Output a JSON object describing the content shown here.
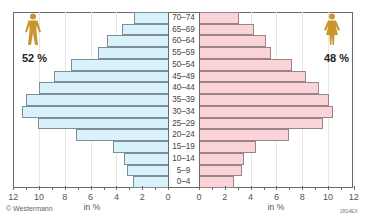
{
  "chart_data": {
    "type": "bar",
    "subtype": "population-pyramid",
    "orientation": "horizontal",
    "categories": [
      "70–74",
      "65–69",
      "60–64",
      "55–59",
      "50–54",
      "45–49",
      "40–44",
      "35–39",
      "30–34",
      "25–29",
      "20–24",
      "15–19",
      "10–14",
      "5–9",
      "0–4"
    ],
    "series": [
      {
        "name": "male",
        "share_label": "52 %",
        "color": "#d9f1fb",
        "values": [
          2.6,
          3.6,
          4.7,
          5.4,
          7.5,
          8.8,
          10.0,
          11.0,
          11.3,
          10.1,
          7.1,
          4.3,
          3.4,
          3.2,
          2.7
        ]
      },
      {
        "name": "female",
        "share_label": "48 %",
        "color": "#fad4d8",
        "values": [
          3.1,
          4.3,
          5.2,
          5.6,
          7.2,
          8.3,
          9.3,
          10.1,
          10.4,
          9.6,
          7.0,
          4.4,
          3.5,
          3.3,
          2.7
        ]
      }
    ],
    "xlabel": "in %",
    "x_ticks_left": [
      "12",
      "10",
      "8",
      "6",
      "4",
      "2",
      "0"
    ],
    "x_ticks_right": [
      "0",
      "2",
      "4",
      "6",
      "8",
      "10",
      "12"
    ],
    "xlim": [
      0,
      12
    ],
    "grid": true,
    "legend": "icons with percentages in upper corners"
  },
  "labels": {
    "male_share": "52 %",
    "female_share": "48 %",
    "unit_left": "in %",
    "unit_right": "in %",
    "credit": "© Westermann",
    "code": "2814EX"
  },
  "colors": {
    "male_bar": "#d9f1fb",
    "female_bar": "#fad4d8",
    "icon": "#c8962a",
    "frame": "#6b6b6b"
  }
}
